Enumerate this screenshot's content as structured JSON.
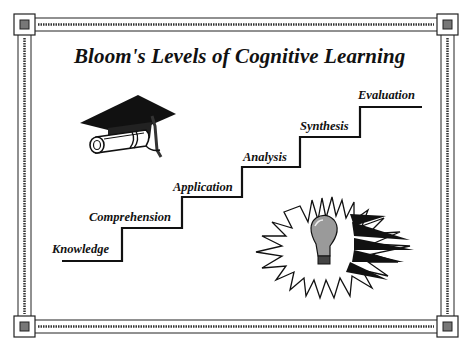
{
  "title": "Bloom's Levels of Cognitive Learning",
  "levels": [
    {
      "label": "Knowledge",
      "order": 1
    },
    {
      "label": "Comprehension",
      "order": 2
    },
    {
      "label": "Application",
      "order": 3
    },
    {
      "label": "Analysis",
      "order": 4
    },
    {
      "label": "Synthesis",
      "order": 5
    },
    {
      "label": "Evaluation",
      "order": 6
    }
  ],
  "illustrations": {
    "top_left": "graduation-cap-with-diploma",
    "bottom_right": "light-bulb-burst"
  },
  "colors": {
    "ink": "#111111",
    "background": "#ffffff",
    "bulb_gray": "#9a9a9a"
  }
}
